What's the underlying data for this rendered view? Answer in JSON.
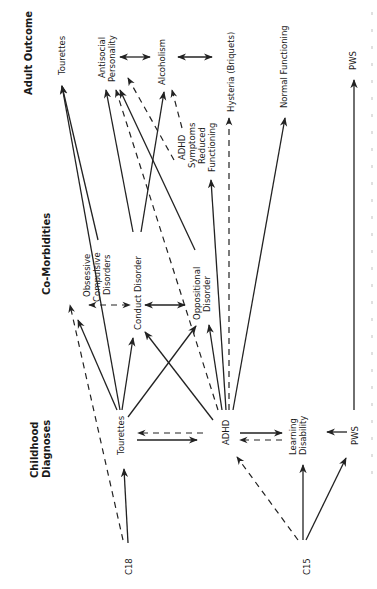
{
  "diagram": {
    "orientation": "rotated-90-ccw",
    "row_headers": {
      "adult_outcome": "Adult Outcome",
      "co_morbidities": "Co-Morbidities",
      "childhood_diagnoses": "Childhood Diagnoses"
    },
    "nodes": {
      "c18": "C18",
      "c15": "C15",
      "tourettes_child": "Tourettes",
      "adhd": "ADHD",
      "learning_disability_1": "Learning",
      "learning_disability_2": "Disability",
      "pws_child": "PWS",
      "ocd_1": "Obsessive",
      "ocd_2": "Compulsive",
      "ocd_3": "Disorders",
      "conduct_disorder": "Conduct Disorder",
      "odd_1": "Oppositional",
      "odd_2": "Disorder",
      "tourettes_adult": "Tourettes",
      "antisocial_1": "Antisocial",
      "antisocial_2": "Personality",
      "alcoholism": "Alcoholism",
      "adhd_symptoms_1": "ADHD",
      "adhd_symptoms_2": "Symptoms",
      "adhd_symptoms_3": "Reduced",
      "adhd_symptoms_4": "Functioning",
      "hysteria": "Hysteria (Briquets)",
      "normal_functioning": "Normal Functioning",
      "pws_adult": "PWS"
    },
    "edges": [
      {
        "from": "C18",
        "to": "Tourettes (child)",
        "style": "solid"
      },
      {
        "from": "C18",
        "to": "Obsessive Compulsive Disorders",
        "style": "dashed"
      },
      {
        "from": "C15",
        "to": "ADHD",
        "style": "dashed"
      },
      {
        "from": "C15",
        "to": "Learning Disability",
        "style": "solid"
      },
      {
        "from": "C15",
        "to": "PWS (child)",
        "style": "solid"
      },
      {
        "from": "Tourettes (child)",
        "to": "ADHD",
        "style": "solid"
      },
      {
        "from": "ADHD",
        "to": "Tourettes (child)",
        "style": "dashed"
      },
      {
        "from": "ADHD",
        "to": "Learning Disability",
        "style": "solid"
      },
      {
        "from": "Learning Disability",
        "to": "ADHD",
        "style": "dashed"
      },
      {
        "from": "PWS (child)",
        "to": "Learning Disability",
        "style": "solid"
      },
      {
        "from": "PWS (child)",
        "to": "PWS (adult)",
        "style": "solid"
      },
      {
        "from": "Tourettes (child)",
        "to": "Obsessive Compulsive Disorders",
        "style": "solid"
      },
      {
        "from": "Tourettes (child)",
        "to": "Conduct Disorder",
        "style": "solid"
      },
      {
        "from": "Tourettes (child)",
        "to": "Oppositional Disorder",
        "style": "solid"
      },
      {
        "from": "Tourettes (child)",
        "to": "Tourettes (adult)",
        "style": "solid"
      },
      {
        "from": "ADHD",
        "to": "Conduct Disorder",
        "style": "solid"
      },
      {
        "from": "ADHD",
        "to": "Oppositional Disorder",
        "style": "solid"
      },
      {
        "from": "ADHD",
        "to": "Antisocial Personality",
        "style": "dashed"
      },
      {
        "from": "ADHD",
        "to": "ADHD Symptoms Reduced Functioning",
        "style": "solid"
      },
      {
        "from": "ADHD",
        "to": "Hysteria (Briquets)",
        "style": "dashed"
      },
      {
        "from": "ADHD",
        "to": "Normal Functioning",
        "style": "solid"
      },
      {
        "from": "Obsessive Compulsive Disorders",
        "to": "Tourettes (adult)",
        "style": "solid"
      },
      {
        "from": "Obsessive Compulsive Disorders",
        "to": "Conduct Disorder",
        "style": "dashed-bidirectional"
      },
      {
        "from": "Conduct Disorder",
        "to": "Oppositional Disorder",
        "style": "solid-bidirectional"
      },
      {
        "from": "Conduct Disorder",
        "to": "Antisocial Personality",
        "style": "solid"
      },
      {
        "from": "Conduct Disorder",
        "to": "Alcoholism",
        "style": "solid"
      },
      {
        "from": "Oppositional Disorder",
        "to": "Antisocial Personality",
        "style": "solid"
      },
      {
        "from": "Oppositional Disorder",
        "to": "Antisocial Personality",
        "style": "dashed"
      },
      {
        "from": "Oppositional Disorder",
        "to": "Alcoholism",
        "style": "dashed"
      },
      {
        "from": "Antisocial Personality",
        "to": "Alcoholism",
        "style": "solid-bidirectional"
      },
      {
        "from": "Alcoholism",
        "to": "Hysteria (Briquets)",
        "style": "solid-bidirectional"
      }
    ]
  }
}
